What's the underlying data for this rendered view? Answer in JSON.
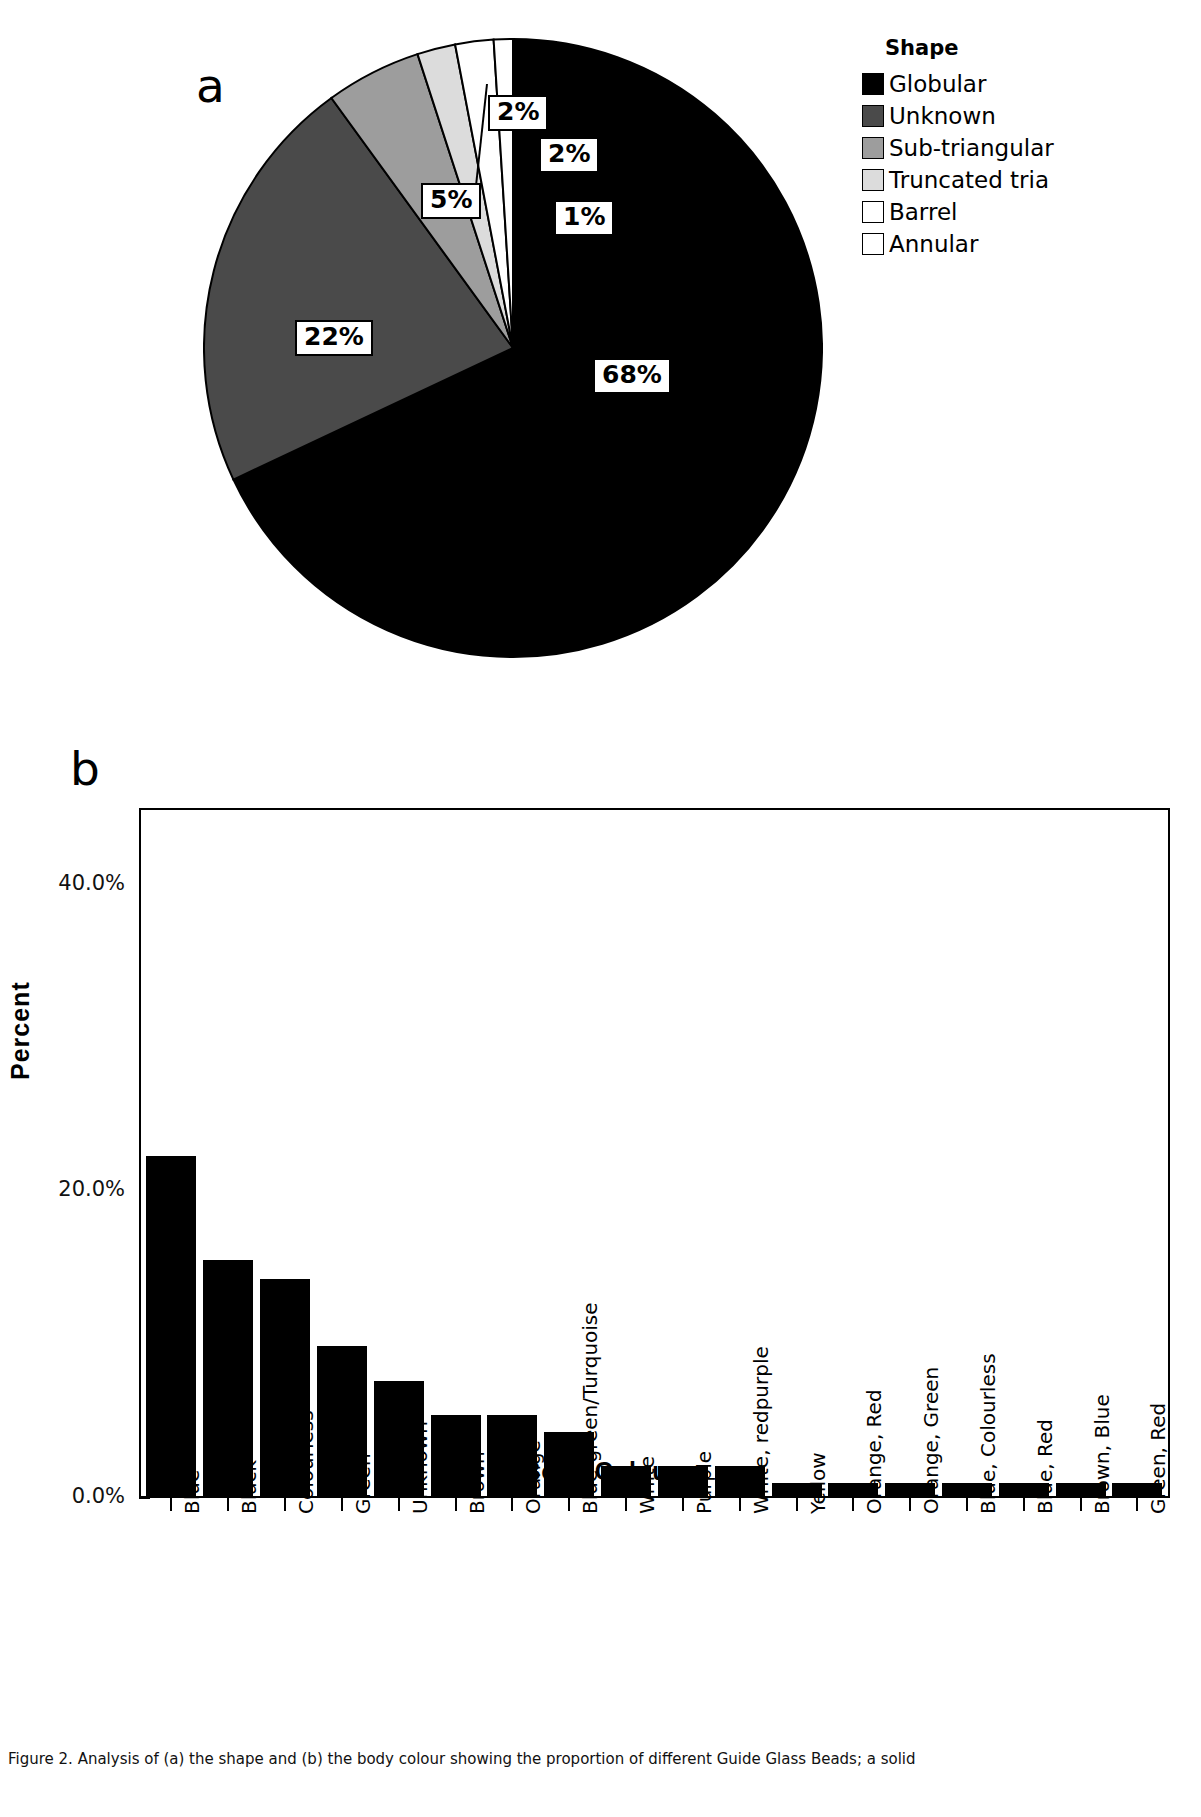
{
  "figure": {
    "panel_a_label": "a",
    "panel_b_label": "b",
    "caption": "Figure 2. Analysis of (a) the shape and (b) the body colour showing the proportion of different Guide Glass Beads; a solid"
  },
  "legend": {
    "title": "Shape",
    "items": [
      {
        "label": "Globular",
        "color": "#000000"
      },
      {
        "label": "Unknown",
        "color": "#4a4a4a"
      },
      {
        "label": "Sub-triangular",
        "color": "#9d9d9d"
      },
      {
        "label": "Truncated tria",
        "color": "#dcdcdc"
      },
      {
        "label": "Barrel",
        "color": "#ffffff"
      },
      {
        "label": "Annular",
        "color": "#ffffff"
      }
    ]
  },
  "chart_data": [
    {
      "type": "pie",
      "title": "Shape",
      "panel": "a",
      "labels": [
        "Globular",
        "Unknown",
        "Sub-triangular",
        "Truncated tria",
        "Barrel",
        "Annular"
      ],
      "values": [
        68,
        22,
        5,
        2,
        2,
        1
      ],
      "data_labels": [
        "68%",
        "22%",
        "5%",
        "2%",
        "2%",
        "1%"
      ],
      "colors": [
        "#000000",
        "#4a4a4a",
        "#9d9d9d",
        "#dcdcdc",
        "#ffffff",
        "#ffffff"
      ],
      "legend_position": "right",
      "start_angle_deg": 0,
      "direction": "clockwise"
    },
    {
      "type": "bar",
      "panel": "b",
      "title": "",
      "xlabel": "Body Colour",
      "ylabel": "Percent",
      "ylim": [
        0,
        45
      ],
      "yticks": [
        0,
        20,
        40
      ],
      "ytick_labels": [
        "0.0%",
        "20.0%",
        "40.0%"
      ],
      "grid": false,
      "bar_color": "#000000",
      "categories": [
        "Blue",
        "Black",
        "Colourless",
        "Green",
        "Unknown",
        "Brown",
        "Orange",
        "Blue-green/Turquoise",
        "White",
        "Purple",
        "White, redpurple",
        "Yellow",
        "Orange, Red",
        "Orange, Green",
        "Blue, Colourless",
        "Blue, Red",
        "Brown, Blue",
        "Green, Red"
      ],
      "values": [
        22.3,
        15.5,
        14.3,
        9.9,
        7.6,
        5.4,
        5.4,
        4.3,
        2.1,
        2.1,
        2.1,
        1.0,
        1.0,
        1.0,
        1.0,
        1.0,
        1.0,
        1.0
      ]
    }
  ]
}
